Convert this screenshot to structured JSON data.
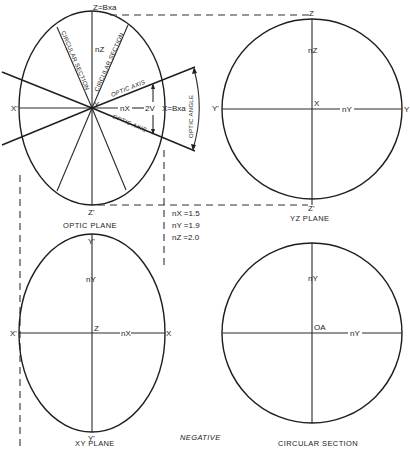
{
  "figure": {
    "caption_type": "NEGATIVE",
    "panels": {
      "optic_plane": {
        "caption": "OPTIC PLANE",
        "top_label": "Z=Bxa",
        "bottom_label": "Z'",
        "left_label": "X'",
        "right_label": "X=Bxa",
        "center_label": "Y",
        "vertical_axis_label": "nZ",
        "horizontal_axis_label": "nX",
        "angle_label": "2V",
        "circular_section_label_1": "CIRCULAR SECTION",
        "circular_section_label_2": "CIRCULAR SECTION",
        "optic_axis_label_1": "OPTIC AXIS",
        "optic_axis_label_2": "OPTIC AXIS",
        "optic_angle_label": "OPTIC ANGLE"
      },
      "yz_plane": {
        "caption": "YZ PLANE",
        "top_label": "Z",
        "bottom_label": "Z'",
        "left_label": "Y'",
        "right_label": "Y",
        "center_label": "X",
        "vertical_axis_label": "nZ",
        "horizontal_axis_label": "nY"
      },
      "xy_plane": {
        "caption": "XY PLANE",
        "top_label": "Y'",
        "bottom_label": "Y'",
        "left_label": "X'",
        "right_label": "X",
        "center_label": "Z",
        "vertical_axis_label": "nY",
        "horizontal_axis_label": "nX"
      },
      "circular_section": {
        "caption": "CIRCULAR SECTION",
        "center_label": "OA",
        "vertical_axis_label": "nY",
        "horizontal_axis_label": "nY"
      }
    },
    "refractive_indices": [
      {
        "label": "nX",
        "value": "=1.5"
      },
      {
        "label": "nY",
        "value": "=1.9"
      },
      {
        "label": "nZ",
        "value": "=2.0"
      }
    ]
  }
}
